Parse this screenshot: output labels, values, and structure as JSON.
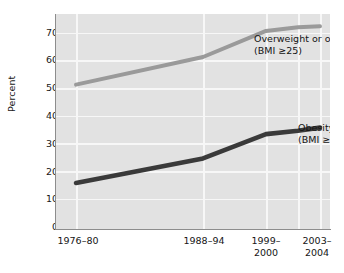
{
  "chart_data": {
    "type": "line",
    "title": "",
    "subtitle": "",
    "xlabel": "",
    "ylabel": "Percent",
    "ylim": [
      0,
      70
    ],
    "yticks": [
      0,
      10,
      20,
      30,
      40,
      50,
      60,
      70
    ],
    "ytick_labels": [
      "0",
      "10",
      "20",
      "30",
      "40",
      "50",
      "60",
      "70"
    ],
    "grid": true,
    "grid_color": "#f7f7f7",
    "panel_color": "#e2e2e2",
    "legend_position": "inline-annotation",
    "categories": [
      "1976–80",
      "1988–94",
      "1999–2000",
      "2001–2002",
      "2003–2004"
    ],
    "x": [
      76,
      203,
      266,
      298,
      320
    ],
    "series": [
      {
        "name": "Overweight or obese (BMI ≥25)",
        "short_name": "Overweight or obese",
        "criterion": "(BMI ≥25)",
        "color": "#9a9a9a",
        "values": [
          47,
          56,
          64.5,
          65.7,
          66
        ]
      },
      {
        "name": "Obesity (BMI ≥30)",
        "short_name": "Obesity",
        "criterion": "(BMI ≥30)",
        "color": "#3a3a3a",
        "values": [
          15,
          23,
          30.9,
          32,
          33
        ]
      }
    ],
    "annotations": [
      {
        "id": "overweight-label",
        "line1": "Overweight or obese",
        "line2": "(BMI ≥25)"
      },
      {
        "id": "obesity-label",
        "line1": "Obesity",
        "line2": "(BMI ≥30)"
      },
      {
        "id": "year-2001-2002",
        "line1": "2001–",
        "line2": "2002"
      }
    ],
    "xtick_labels": [
      {
        "line1": "1976–80",
        "line2": ""
      },
      {
        "line1": "1988–94",
        "line2": ""
      },
      {
        "line1": "1999–",
        "line2": "2000"
      },
      {
        "line1": "2003–",
        "line2": "2004"
      }
    ]
  }
}
